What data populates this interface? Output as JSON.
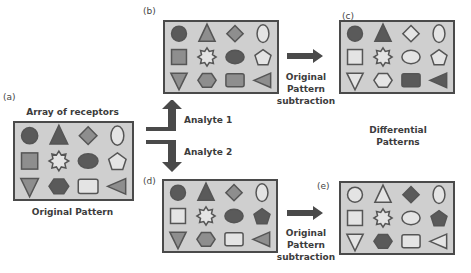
{
  "colors": {
    "dark": "#5a5a5a",
    "medium": "#8e8e8e",
    "light": "#e4e4e4",
    "panel_bg": "#cfcfcf",
    "border": "#4a4a4a",
    "arrow": "#4a4a4a"
  },
  "labels": {
    "a": "(a)",
    "b": "(b)",
    "c": "(c)",
    "d": "(d)",
    "e": "(e)",
    "array_title": "Array of receptors",
    "original_pattern": "Original Pattern",
    "analyte1": "Analyte 1",
    "analyte2": "Analyte 2",
    "subtraction_top": [
      "Original",
      "Pattern",
      "subtraction"
    ],
    "subtraction_bottom": [
      "Original",
      "Pattern",
      "subtraction"
    ],
    "differential": [
      "Differential",
      "Patterns"
    ]
  },
  "shapes": [
    "circle",
    "triangle",
    "diamond",
    "ellipse",
    "square",
    "star",
    "oval",
    "pentagon",
    "triangle-down",
    "hexagon",
    "rounded-rect",
    "triangle-left"
  ],
  "panels": {
    "a": [
      "dark",
      "dark",
      "medium",
      "light",
      "medium",
      "light",
      "dark",
      "light",
      "medium",
      "dark",
      "light",
      "medium"
    ],
    "b": [
      "dark",
      "medium",
      "medium",
      "light",
      "medium",
      "light",
      "dark",
      "light",
      "medium",
      "medium",
      "medium",
      "medium"
    ],
    "c": [
      "dark",
      "dark",
      "light",
      "light",
      "light",
      "light",
      "light",
      "light",
      "light",
      "light",
      "dark",
      "dark"
    ],
    "d": [
      "dark",
      "dark",
      "medium",
      "light",
      "light",
      "light",
      "dark",
      "dark",
      "medium",
      "medium",
      "light",
      "medium"
    ],
    "e": [
      "light",
      "light",
      "dark",
      "light",
      "light",
      "light",
      "light",
      "dark",
      "light",
      "dark",
      "light",
      "light"
    ]
  }
}
